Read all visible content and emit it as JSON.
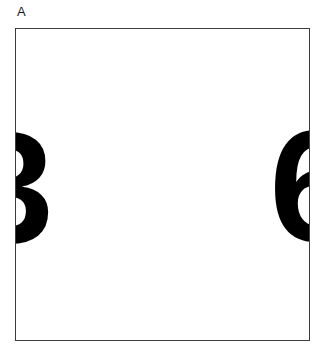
{
  "figure": {
    "panel_label": "A",
    "background_color": "#ffffff",
    "frame": {
      "border_color": "#3c3c3c",
      "fill_color": "#ffffff",
      "border_width_px": 1.4
    },
    "stimuli": [
      {
        "id": "left",
        "character": "3",
        "color": "#000000",
        "position": "left-edge",
        "clipped": "left"
      },
      {
        "id": "right",
        "character": "6",
        "color": "#000000",
        "position": "right-edge",
        "clipped": "right"
      }
    ]
  },
  "chart_data": {
    "type": "scatter",
    "title": "",
    "subtitle": "",
    "xlabel": "",
    "ylabel": "",
    "annotations": [
      "A"
    ],
    "legend": [],
    "grid": false,
    "xlim": [
      0,
      1
    ],
    "ylim": [
      0,
      1
    ],
    "xtick_labels": [],
    "ytick_labels": [],
    "series": [
      {
        "name": "stimulus-characters",
        "marker": "text-glyph",
        "color": "#000000",
        "points": [
          {
            "label": "3",
            "x": 0.0,
            "y": 0.5
          },
          {
            "label": "6",
            "x": 1.0,
            "y": 0.5
          }
        ]
      }
    ]
  }
}
